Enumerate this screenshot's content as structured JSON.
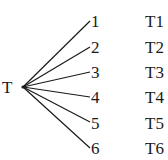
{
  "diagram": {
    "type": "tree",
    "root": {
      "label": "T"
    },
    "branches": [
      {
        "label": "1",
        "outcome": "T1"
      },
      {
        "label": "2",
        "outcome": "T2"
      },
      {
        "label": "3",
        "outcome": "T3"
      },
      {
        "label": "4",
        "outcome": "T4"
      },
      {
        "label": "5",
        "outcome": "T5"
      },
      {
        "label": "6",
        "outcome": "T6"
      }
    ]
  }
}
